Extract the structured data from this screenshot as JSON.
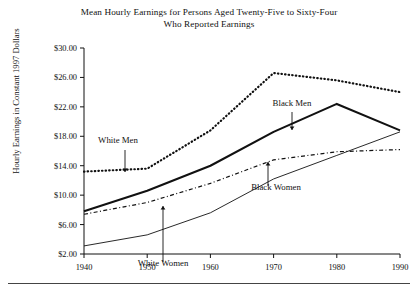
{
  "figure": {
    "title_line1": "Mean Hourly Earnings for Persons Aged Twenty-Five to Sixty-Four",
    "title_line2": "Who Reported Earnings",
    "ylabel": "Hourly Earnings in Constant 1997 Dollars"
  },
  "annotations": {
    "white_men": "White Men",
    "black_men": "Black Men",
    "white_women": "White Women",
    "black_women": "Black Women"
  },
  "chart_data": {
    "type": "line",
    "title": "Mean Hourly Earnings for Persons Aged Twenty-Five to Sixty-Four Who Reported Earnings",
    "xlabel": "",
    "ylabel": "Hourly Earnings in Constant 1997 Dollars",
    "x": [
      1940,
      1950,
      1960,
      1970,
      1980,
      1990
    ],
    "xlim": [
      1940,
      1990
    ],
    "ylim": [
      2.0,
      30.0
    ],
    "ytick_labels": [
      "$2.00",
      "$6.00",
      "$10.00",
      "$14.00",
      "$18.00",
      "$22.00",
      "$26.00",
      "$30.00"
    ],
    "ytick_values": [
      2.0,
      6.0,
      10.0,
      14.0,
      18.0,
      22.0,
      26.0,
      30.0
    ],
    "xtick_labels": [
      "1940",
      "1950",
      "1960",
      "1970",
      "1980",
      "1990"
    ],
    "grid": false,
    "legend_position": "inline-annotations",
    "series": [
      {
        "name": "White Men",
        "style": "dotted-heavy",
        "values": [
          13.2,
          13.6,
          18.8,
          26.6,
          25.6,
          24.0
        ]
      },
      {
        "name": "Black Men",
        "style": "solid-thick",
        "values": [
          7.8,
          10.6,
          14.0,
          18.6,
          22.4,
          18.8
        ]
      },
      {
        "name": "White Women",
        "style": "dash-dot",
        "values": [
          7.4,
          9.0,
          11.6,
          14.8,
          15.9,
          16.2
        ]
      },
      {
        "name": "Black Women",
        "style": "solid-thin",
        "values": [
          3.1,
          4.6,
          7.6,
          12.2,
          15.4,
          18.6
        ]
      }
    ]
  }
}
